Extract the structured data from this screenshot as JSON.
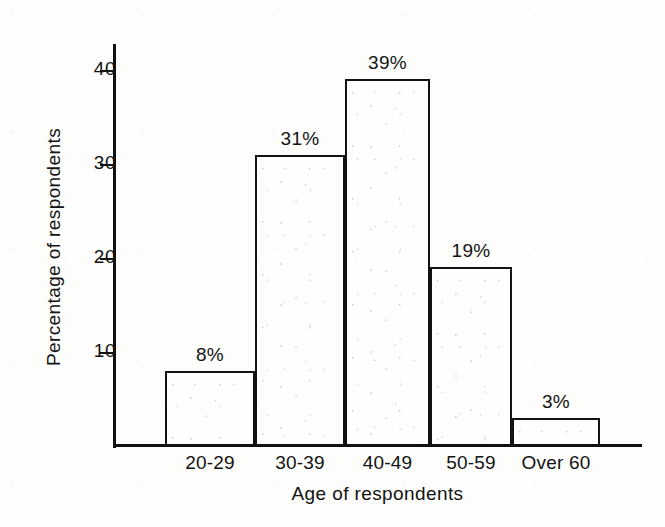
{
  "chart_data": {
    "type": "bar",
    "title": "",
    "subtitle": "",
    "xlabel": "Age of respondents",
    "ylabel": "Percentage of respondents",
    "categories": [
      "20-29",
      "30-39",
      "40-49",
      "50-59",
      "Over 60"
    ],
    "values": [
      8,
      31,
      39,
      19,
      3
    ],
    "data_labels": [
      "8%",
      "31%",
      "39%",
      "19%",
      "3%"
    ],
    "ylim": [
      0,
      44
    ],
    "yticks": [
      10,
      20,
      30,
      40
    ],
    "ytick_labels": [
      "10",
      "20",
      "30",
      "40"
    ],
    "grid": false,
    "legend": "none",
    "series": [
      {
        "name": "Percentage of respondents",
        "values": [
          8,
          31,
          39,
          19,
          3
        ]
      }
    ]
  },
  "axes": {
    "y_title": "Percentage of respondents",
    "x_title": "Age of respondents",
    "ticks": [
      {
        "label": "40",
        "value": 40
      },
      {
        "label": "30",
        "value": 30
      },
      {
        "label": "20",
        "value": 20
      },
      {
        "label": "10",
        "value": 10
      }
    ]
  },
  "bars": [
    {
      "category": "20-29",
      "value": 8,
      "label": "8%"
    },
    {
      "category": "30-39",
      "value": 31,
      "label": "31%"
    },
    {
      "category": "40-49",
      "value": 39,
      "label": "39%"
    },
    {
      "category": "50-59",
      "value": 19,
      "label": "19%"
    },
    {
      "category": "Over 60",
      "value": 3,
      "label": "3%"
    }
  ],
  "colors": {
    "ink": "#121212",
    "paper": "#fdfdfc",
    "bar_fill": "#fefefe"
  }
}
